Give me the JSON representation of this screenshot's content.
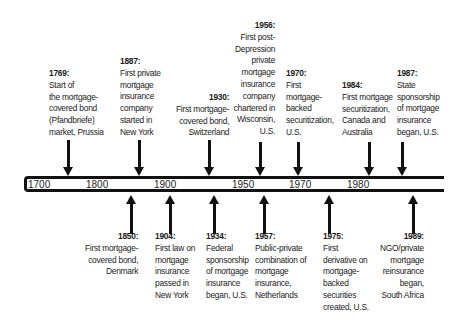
{
  "timeline": {
    "ticks": [
      "1700",
      "1800",
      "1900",
      "1950",
      "1970",
      "1980"
    ],
    "above": [
      {
        "year": "1769:",
        "lines": [
          "Start of",
          "the mortgage-",
          "covered bond",
          "(Pfandbriefe)",
          "market, Prussia"
        ]
      },
      {
        "year": "1887:",
        "lines": [
          "First private",
          "mortgage",
          "insurance",
          "company",
          "started in",
          "New York"
        ]
      },
      {
        "year": "1930:",
        "lines": [
          "First mortgage-",
          "covered bond,",
          "Switzerland"
        ]
      },
      {
        "year": "1956:",
        "lines": [
          "First post-",
          "Depression",
          "private",
          "mortgage",
          "insurance",
          "company",
          "chartered in",
          "Wisconsin,",
          "U.S."
        ]
      },
      {
        "year": "1970:",
        "lines": [
          "First",
          "mortgage-",
          "backed",
          "securitization,",
          "U.S."
        ]
      },
      {
        "year": "1984:",
        "lines": [
          "First mortgage",
          "securitization,",
          "Canada and",
          "Australia"
        ]
      },
      {
        "year": "1987:",
        "lines": [
          "State",
          "sponsorship",
          "of mortgage",
          "insurance",
          "began, U.S."
        ]
      }
    ],
    "below": [
      {
        "year": "1850:",
        "lines": [
          "First mortgage-",
          "covered bond,",
          "Denmark"
        ]
      },
      {
        "year": "1904:",
        "lines": [
          "First law on",
          "mortgage",
          "insurance",
          "passed in",
          "New York"
        ]
      },
      {
        "year": "1934:",
        "lines": [
          "Federal",
          "sponsorship",
          "of mortgage",
          "insurance",
          "began, U.S."
        ]
      },
      {
        "year": "1957:",
        "lines": [
          "Public-private",
          "combination of",
          "mortgage",
          "insurance,",
          "Netherlands"
        ]
      },
      {
        "year": "1975:",
        "lines": [
          "First",
          "derivative on",
          "mortgage-",
          "backed",
          "securities",
          "created, U.S."
        ]
      },
      {
        "year": "1989:",
        "lines": [
          "NGO/private",
          "mortgage",
          "reinsurance",
          "began,",
          "South Africa"
        ]
      }
    ]
  }
}
